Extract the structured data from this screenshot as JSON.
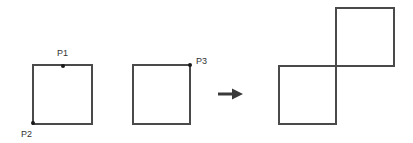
{
  "figure": {
    "title": "",
    "background_color": "#ffffff",
    "stroke_color": "#4a4a4a",
    "point_color": "#1a1a1a",
    "label_color": "#333333",
    "stroke_width": 1.5,
    "width": 413,
    "height": 143
  },
  "shapes": {
    "square_1": {
      "name": "source-square-with-points",
      "x": 33,
      "y": 65,
      "width": 59,
      "height": 59
    },
    "square_2": {
      "name": "target-square-with-point",
      "x": 133,
      "y": 65,
      "width": 57,
      "height": 59
    },
    "result_square_lower_left": {
      "name": "result-square-lower-left",
      "x": 279,
      "y": 66,
      "width": 57,
      "height": 58
    },
    "result_square_upper_right": {
      "name": "result-square-upper-right",
      "x": 336,
      "y": 8,
      "width": 58,
      "height": 58
    }
  },
  "points": [
    {
      "id": "P1",
      "label": "P1",
      "cx": 63,
      "cy": 66,
      "label_x": 57,
      "label_y": 56,
      "radius": 2
    },
    {
      "id": "P2",
      "label": "P2",
      "cx": 33,
      "cy": 123,
      "label_x": 21,
      "label_y": 137,
      "radius": 2
    },
    {
      "id": "P3",
      "label": "P3",
      "cx": 190,
      "cy": 65,
      "label_x": 196,
      "label_y": 64,
      "radius": 2
    }
  ],
  "arrow": {
    "name": "transformation-arrow",
    "x_start": 218,
    "x_end": 243,
    "y": 94,
    "shaft_width": 3,
    "head_length": 11,
    "head_width": 11,
    "color": "#3a3a3a"
  }
}
